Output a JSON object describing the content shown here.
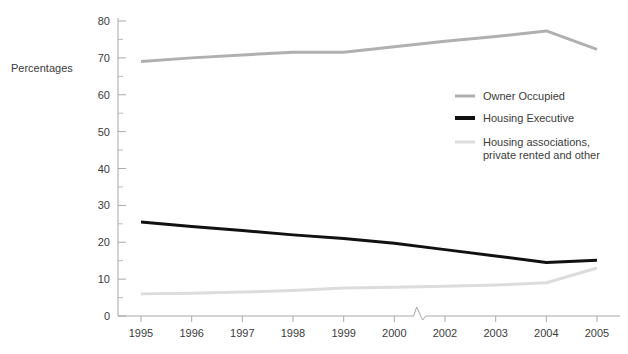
{
  "chart_data": {
    "type": "line",
    "title": "",
    "xlabel": "",
    "ylabel": "Percentages",
    "ylim": [
      0,
      80
    ],
    "ytick_step": 10,
    "yminor_step": 5,
    "grid": false,
    "legend_position": "right-middle",
    "axis_break": {
      "present": true,
      "between": [
        "2000",
        "2002"
      ],
      "note": "zigzag break mark on x-axis between 2000 and 2002"
    },
    "categories": [
      "1995",
      "1996",
      "1997",
      "1998",
      "1999",
      "2000",
      "2002",
      "2003",
      "2004",
      "2005"
    ],
    "series": [
      {
        "name": "Owner Occupied",
        "color": "#b0b0b0",
        "width": 3,
        "values": [
          69,
          70,
          70.8,
          71.5,
          71.5,
          73,
          74.5,
          75.8,
          77.3,
          72.3
        ]
      },
      {
        "name": "Housing Executive",
        "color": "#111111",
        "width": 3,
        "values": [
          25.5,
          24.3,
          23.2,
          22,
          21,
          19.7,
          18,
          16.3,
          14.5,
          15.1
        ]
      },
      {
        "name": "Housing associations, private rented and other",
        "color": "#dcdcdc",
        "width": 3,
        "values": [
          6,
          6.2,
          6.5,
          6.9,
          7.6,
          7.8,
          8.1,
          8.4,
          9,
          13
        ]
      }
    ],
    "ytick_labels": [
      "0",
      "10",
      "20",
      "30",
      "40",
      "50",
      "60",
      "70",
      "80"
    ],
    "legend_entries": [
      {
        "label": "Owner Occupied",
        "label2": "",
        "color": "#b0b0b0"
      },
      {
        "label": "Housing Executive",
        "label2": "",
        "color": "#111111"
      },
      {
        "label": "Housing associations,",
        "label2": "private rented and other",
        "color": "#dcdcdc"
      }
    ]
  },
  "axis": {
    "y_axis_title": "Percentages"
  }
}
